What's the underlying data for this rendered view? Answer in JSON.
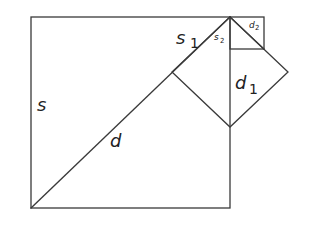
{
  "figure": {
    "labels": {
      "s": {
        "main": "s",
        "sub": ""
      },
      "d": {
        "main": "d",
        "sub": ""
      },
      "s1": {
        "main": "s",
        "sub": "1"
      },
      "d1": {
        "main": "d",
        "sub": "1"
      },
      "s2": {
        "main": "s",
        "sub": "2"
      },
      "d2": {
        "main": "d",
        "sub": "2"
      }
    },
    "shapes": {
      "big_square": {
        "x1": 31,
        "y1": 17,
        "x2": 230,
        "y2": 208
      },
      "diagonal_d": {
        "x1": 31,
        "y1": 208,
        "x2": 230,
        "y2": 17
      },
      "medium_square": {
        "points": "230,17 288,72 230,127 172,72"
      },
      "small_square": {
        "x1": 230,
        "y1": 17,
        "x2": 264,
        "y2": 49
      },
      "diagonal_d2": {
        "x1": 230,
        "y1": 17,
        "x2": 264,
        "y2": 49
      }
    },
    "colors": {
      "stroke": "#3a3a3a",
      "text": "#222222",
      "background": "#ffffff"
    }
  }
}
